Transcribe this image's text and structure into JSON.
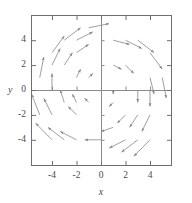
{
  "figure": {
    "type": "vector-field-plot",
    "background_color": "#ffffff",
    "frame_color": "#6e6e73",
    "axis_color": "#8a8a8f",
    "arrow_color": "#8c8c96",
    "text_color": "#4a4a4f",
    "width": 192,
    "height": 203
  },
  "axes": {
    "x_title": "x",
    "y_title": "y",
    "x_ticks": [
      "-4",
      "-2",
      "0",
      "2",
      "4"
    ],
    "y_ticks": [
      "4",
      "2",
      "0",
      "-2",
      "-4"
    ]
  },
  "chart_data": {
    "type": "scatter",
    "subtype": "vector-field",
    "title": "",
    "xlabel": "x",
    "ylabel": "y",
    "xlim": [
      -5.75,
      5.8
    ],
    "ylim": [
      -6.1,
      6.1
    ],
    "xticks": [
      -4,
      -2,
      0,
      2,
      4
    ],
    "yticks": [
      -4,
      -2,
      0,
      2,
      4
    ],
    "grid": false,
    "legend": null,
    "field_equation": "F(x, y) = (y, -x)",
    "rotation": "clockwise",
    "magnitude_rule": "proportional to distance from origin",
    "arrow_scale": 0.33,
    "sample_grid_x": [
      -5,
      -4,
      -3,
      -2,
      -1,
      0,
      1,
      2,
      3,
      4,
      5
    ],
    "sample_grid_y": [
      -5,
      -4,
      -3,
      -2,
      -1,
      0,
      1,
      2,
      3,
      4,
      5
    ],
    "sample_radius_limit": 5.6,
    "vectors": [
      {
        "x": -4,
        "y": 3,
        "u": 3,
        "v": 4
      },
      {
        "x": -3,
        "y": 4,
        "u": 4,
        "v": 3
      },
      {
        "x": -2,
        "y": 4,
        "u": 4,
        "v": 2
      },
      {
        "x": -1,
        "y": 5,
        "u": 5,
        "v": 1
      },
      {
        "x": -4,
        "y": 2,
        "u": 2,
        "v": 4
      },
      {
        "x": -3,
        "y": 2,
        "u": 2,
        "v": 3
      },
      {
        "x": -2,
        "y": 3,
        "u": 3,
        "v": 2
      },
      {
        "x": -5,
        "y": 1,
        "u": 1,
        "v": 5
      },
      {
        "x": -4,
        "y": 0,
        "u": 0,
        "v": 4
      },
      {
        "x": -2,
        "y": 1,
        "u": 1,
        "v": 2
      },
      {
        "x": -1,
        "y": 1,
        "u": 1,
        "v": 1
      },
      {
        "x": 1,
        "y": 4,
        "u": 4,
        "v": -1
      },
      {
        "x": 2,
        "y": 4,
        "u": 4,
        "v": -2
      },
      {
        "x": 3,
        "y": 4,
        "u": 4,
        "v": -3
      },
      {
        "x": 4,
        "y": 3,
        "u": 3,
        "v": -4
      },
      {
        "x": 1,
        "y": 2,
        "u": 2,
        "v": -1
      },
      {
        "x": 2,
        "y": 2,
        "u": 2,
        "v": -2
      },
      {
        "x": 4,
        "y": 1,
        "u": 1,
        "v": -4
      },
      {
        "x": 5,
        "y": 1,
        "u": 1,
        "v": -5
      },
      {
        "x": 1,
        "y": 0,
        "u": 0,
        "v": -1
      },
      {
        "x": 3,
        "y": 0,
        "u": 0,
        "v": -3
      },
      {
        "x": 4,
        "y": 0,
        "u": 0,
        "v": -4
      },
      {
        "x": 1,
        "y": -1,
        "u": -1,
        "v": -1
      },
      {
        "x": 2,
        "y": -2,
        "u": -2,
        "v": -2
      },
      {
        "x": 3,
        "y": -2,
        "u": -2,
        "v": -3
      },
      {
        "x": 4,
        "y": -2,
        "u": -2,
        "v": -4
      },
      {
        "x": 1,
        "y": -3,
        "u": -3,
        "v": -1
      },
      {
        "x": 2,
        "y": -4,
        "u": -4,
        "v": -2
      },
      {
        "x": 3,
        "y": -4,
        "u": -4,
        "v": -3
      },
      {
        "x": 4,
        "y": -4,
        "u": -4,
        "v": -4
      },
      {
        "x": 0,
        "y": -4,
        "u": -4,
        "v": 0
      },
      {
        "x": -1,
        "y": -1,
        "u": -1,
        "v": 1
      },
      {
        "x": -2,
        "y": -1,
        "u": -1,
        "v": 2
      },
      {
        "x": -3,
        "y": -1,
        "u": -1,
        "v": 3
      },
      {
        "x": -2,
        "y": -2,
        "u": -2,
        "v": 2
      },
      {
        "x": -4,
        "y": -2,
        "u": -2,
        "v": 4
      },
      {
        "x": -5,
        "y": -2,
        "u": -2,
        "v": 5
      },
      {
        "x": -2,
        "y": -4,
        "u": -4,
        "v": 2
      },
      {
        "x": -3,
        "y": -4,
        "u": -4,
        "v": 3
      },
      {
        "x": -4,
        "y": -4,
        "u": -4,
        "v": 4
      }
    ]
  }
}
